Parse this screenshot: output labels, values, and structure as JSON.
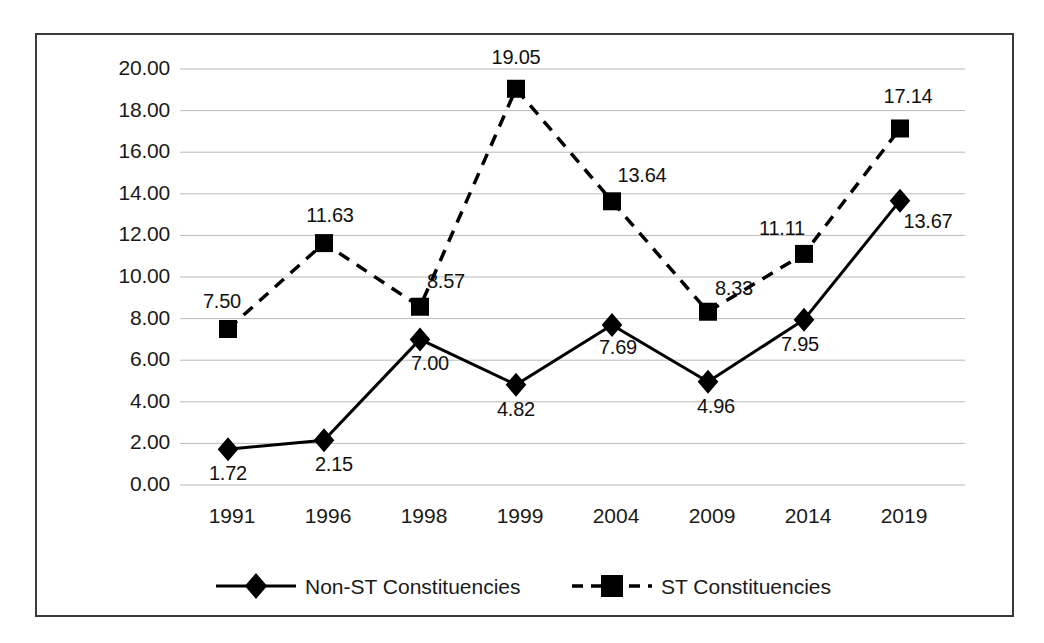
{
  "chart_data": {
    "type": "line",
    "title": "",
    "xlabel": "",
    "ylabel": "",
    "categories": [
      "1991",
      "1996",
      "1998",
      "1999",
      "2004",
      "2009",
      "2014",
      "2019"
    ],
    "ylim": [
      0,
      20
    ],
    "ytick_step": 2,
    "ytick_labels": [
      "20.00",
      "18.00",
      "16.00",
      "14.00",
      "12.00",
      "10.00",
      "8.00",
      "6.00",
      "4.00",
      "2.00",
      "0.00"
    ],
    "ytick_values": [
      20,
      18,
      16,
      14,
      12,
      10,
      8,
      6,
      4,
      2,
      0
    ],
    "grid": true,
    "grid_axis": "y",
    "legend_position": "bottom",
    "series": [
      {
        "name": "Non-ST Constituencies",
        "marker": "diamond",
        "line_style": "solid",
        "color": "#000000",
        "values": [
          1.72,
          2.15,
          7.0,
          4.82,
          7.69,
          4.96,
          7.95,
          13.67
        ],
        "labels": [
          "1.72",
          "2.15",
          "7.00",
          "4.82",
          "7.69",
          "4.96",
          "7.95",
          "13.67"
        ]
      },
      {
        "name": "ST Constituencies",
        "marker": "square",
        "line_style": "dashed",
        "color": "#000000",
        "values": [
          7.5,
          11.63,
          8.57,
          19.05,
          13.64,
          8.33,
          11.11,
          17.14
        ],
        "labels": [
          "7.50",
          "11.63",
          "8.57",
          "19.05",
          "13.64",
          "8.33",
          "11.11",
          "17.14"
        ]
      }
    ]
  },
  "legend": {
    "items": [
      {
        "label": "Non-ST Constituencies",
        "marker": "diamond-marker",
        "line": "solid-line"
      },
      {
        "label": "ST Constituencies",
        "marker": "square-marker",
        "line": "dashed-line"
      }
    ]
  },
  "colors": {
    "series": "#000000",
    "grid": "#b9b9b9",
    "border": "#3a3a3a",
    "text": "#1a1a1a",
    "background": "#ffffff"
  }
}
